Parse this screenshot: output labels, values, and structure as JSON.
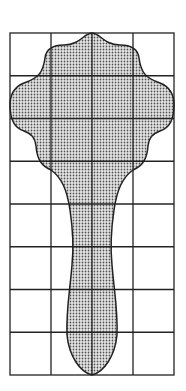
{
  "figure": {
    "grid": {
      "columns": 4,
      "rows": 8,
      "x0": 10,
      "y0": 33,
      "width": 164,
      "height": 342
    },
    "shape_fill": "#b8b8b8",
    "line_color": "#222222"
  }
}
